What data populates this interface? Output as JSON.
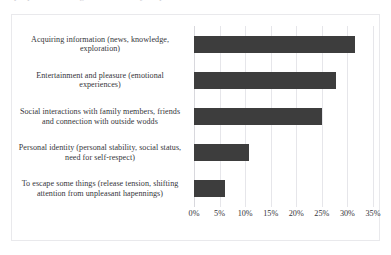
{
  "page": {
    "top_cut_text": "purposes of using the internet by respondents"
  },
  "chart_data": {
    "type": "bar",
    "orientation": "horizontal",
    "title": "",
    "xlabel": "",
    "ylabel": "",
    "grid": true,
    "legend": false,
    "xlim": [
      0,
      35
    ],
    "xticks": [
      0,
      5,
      10,
      15,
      20,
      25,
      30,
      35
    ],
    "xtick_labels": [
      "0%",
      "5%",
      "10%",
      "15%",
      "20%",
      "25%",
      "30%",
      "35%"
    ],
    "bar_color": "#3d3d3d",
    "categories": [
      "Acquiring information (news, knowledge, exploration)",
      "Entertainment and pleasure (emotional experiences)",
      "Social interactions with family members, friends and connection with outside wodds",
      "Personal identity (personal stability, social status, need for self-respect)",
      "To escape some things (release tension, shifting attention from unpleasant hapennings)"
    ],
    "values": [
      31.5,
      27.8,
      25.0,
      10.7,
      6.0
    ]
  }
}
